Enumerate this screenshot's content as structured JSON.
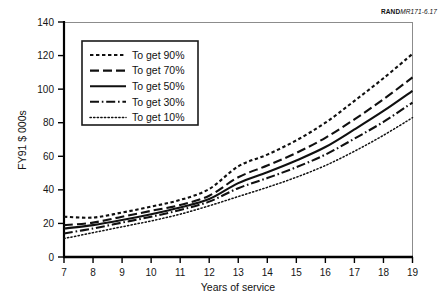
{
  "source_id": {
    "brand": "RAND",
    "document": "MR171-6.17"
  },
  "chart_data": {
    "type": "line",
    "title": "",
    "subtitle": "",
    "xlabel": "Years of service",
    "ylabel": "FY91 $ 000s",
    "xlim": [
      7,
      19
    ],
    "ylim": [
      0,
      140
    ],
    "xticks": [
      7,
      8,
      9,
      10,
      11,
      12,
      13,
      14,
      15,
      16,
      17,
      18,
      19
    ],
    "yticks": [
      0,
      20,
      40,
      60,
      80,
      100,
      120,
      140
    ],
    "xtick_labels": [
      "7",
      "8",
      "9",
      "10",
      "11",
      "12",
      "13",
      "14",
      "15",
      "16",
      "17",
      "18",
      "19"
    ],
    "ytick_labels": [
      "0",
      "20",
      "40",
      "60",
      "80",
      "100",
      "120",
      "140"
    ],
    "grid": false,
    "legend_position": "upper left",
    "x": [
      7,
      8,
      9,
      10,
      11,
      12,
      13,
      14,
      15,
      16,
      17,
      18,
      19
    ],
    "series": [
      {
        "name": "To get 90%",
        "dash": "short-dash",
        "color": "#101010",
        "values": [
          24,
          23.5,
          26.5,
          30,
          34,
          40.5,
          54,
          61,
          69.5,
          80,
          93,
          106.5,
          121
        ]
      },
      {
        "name": "To get 70%",
        "dash": "long-dash",
        "color": "#101010",
        "values": [
          19,
          20.5,
          24,
          27.5,
          31,
          36.5,
          47.5,
          54.5,
          62,
          71,
          82,
          94,
          107
        ]
      },
      {
        "name": "To get 50%",
        "dash": "solid",
        "color": "#101010",
        "values": [
          17,
          19,
          22,
          25.5,
          29.5,
          34.5,
          44,
          50.5,
          57.5,
          65.5,
          76,
          87,
          99
        ]
      },
      {
        "name": "To get 30%",
        "dash": "dash-dot",
        "color": "#101010",
        "values": [
          14,
          17,
          20.5,
          24,
          28,
          33,
          41,
          47,
          53.5,
          61,
          70.5,
          80.5,
          92
        ]
      },
      {
        "name": "To get 10%",
        "dash": "dotted",
        "color": "#101010",
        "values": [
          11,
          14.5,
          18,
          21.5,
          25.5,
          30.5,
          36,
          41.5,
          47.5,
          54.5,
          63,
          72.5,
          83
        ]
      }
    ],
    "legend_entries": [
      {
        "label": "To get 90%",
        "dash": "short-dash"
      },
      {
        "label": "To get 70%",
        "dash": "long-dash"
      },
      {
        "label": "To get 50%",
        "dash": "solid"
      },
      {
        "label": "To get 30%",
        "dash": "dash-dot"
      },
      {
        "label": "To get 10%",
        "dash": "dotted"
      }
    ]
  }
}
